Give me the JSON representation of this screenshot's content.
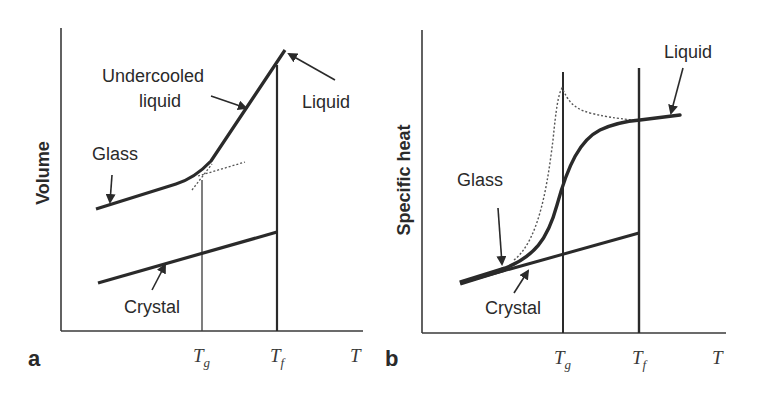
{
  "figure": {
    "panels": [
      {
        "id": "a",
        "panel_label": "a",
        "ylabel": "Volume",
        "xlabel": "T",
        "ticks": [
          {
            "main": "T",
            "sub": "g"
          },
          {
            "main": "T",
            "sub": "f"
          }
        ],
        "annotations": {
          "undercooled_line1": "Undercooled",
          "undercooled_line2": "liquid",
          "liquid": "Liquid",
          "glass": "Glass",
          "crystal": "Crystal"
        }
      },
      {
        "id": "b",
        "panel_label": "b",
        "ylabel": "Specific heat",
        "xlabel": "T",
        "ticks": [
          {
            "main": "T",
            "sub": "g"
          },
          {
            "main": "T",
            "sub": "f"
          }
        ],
        "annotations": {
          "liquid": "Liquid",
          "glass": "Glass",
          "crystal": "Crystal"
        }
      }
    ],
    "colors": {
      "ink": "#2a2a2a",
      "background": "#ffffff"
    }
  }
}
